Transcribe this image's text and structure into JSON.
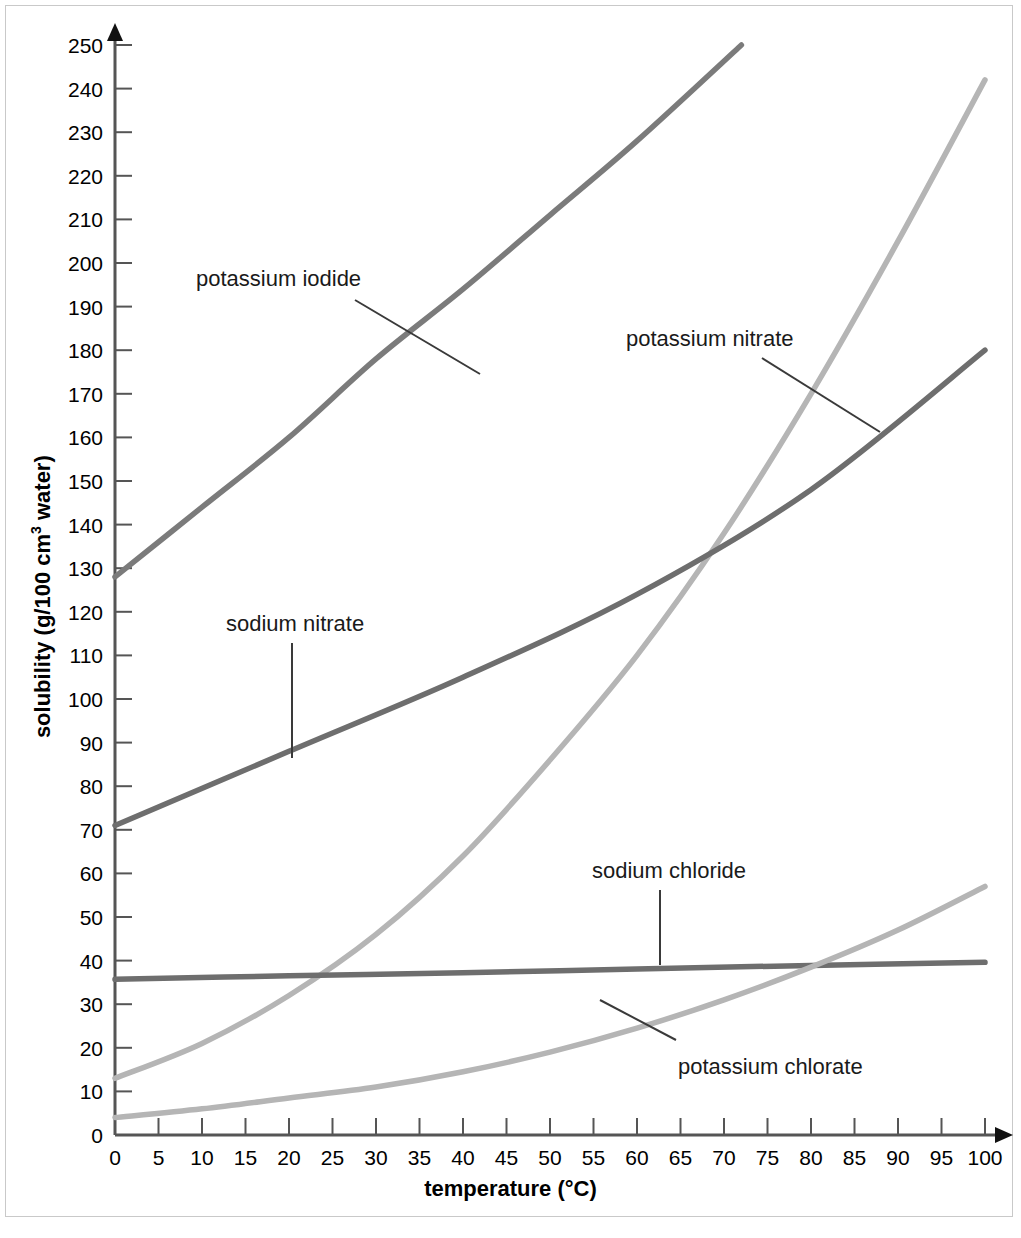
{
  "chart_data": {
    "type": "line",
    "title": "",
    "xlabel": "temperature (°C)",
    "ylabel": "solubility (g/100 cm3 water)",
    "ylabel_parts": {
      "before": "solubility (g/100 cm",
      "sup": "3",
      "after": " water)"
    },
    "xlim": [
      0,
      100
    ],
    "ylim": [
      0,
      250
    ],
    "xticks": [
      0,
      5,
      10,
      15,
      20,
      25,
      30,
      35,
      40,
      45,
      50,
      55,
      60,
      65,
      70,
      75,
      80,
      85,
      90,
      95,
      100
    ],
    "yticks": [
      0,
      10,
      20,
      30,
      40,
      50,
      60,
      70,
      80,
      90,
      100,
      110,
      120,
      130,
      140,
      150,
      160,
      170,
      180,
      190,
      200,
      210,
      220,
      230,
      240,
      250
    ],
    "grid": false,
    "legend": "inline-labels",
    "axis_color": "#555555",
    "series": [
      {
        "name": "potassium iodide",
        "color": "#7b7b7b",
        "label_x": 196,
        "label_y": 268,
        "leader": [
          [
            355,
            300
          ],
          [
            480,
            374
          ]
        ],
        "x": [
          0,
          10,
          20,
          30,
          40,
          50,
          60,
          72
        ],
        "values": [
          128,
          144,
          160,
          178,
          194,
          211,
          228,
          250
        ]
      },
      {
        "name": "potassium nitrate",
        "color": "#b5b5b5",
        "label_x": 626,
        "label_y": 328,
        "leader": [
          [
            762,
            358
          ],
          [
            880,
            432
          ]
        ],
        "x": [
          0,
          10,
          20,
          30,
          40,
          50,
          60,
          70,
          80,
          90,
          100
        ],
        "values": [
          13,
          21,
          32,
          46,
          64,
          86,
          110,
          138,
          170,
          205,
          242
        ]
      },
      {
        "name": "sodium nitrate",
        "color": "#6e6e6e",
        "label_x": 226,
        "label_y": 613,
        "leader": [
          [
            292,
            643
          ],
          [
            292,
            758
          ]
        ],
        "x": [
          0,
          20,
          40,
          60,
          80,
          100
        ],
        "values": [
          71,
          88,
          105,
          124,
          148,
          180
        ]
      },
      {
        "name": "sodium chloride",
        "color": "#6e6e6e",
        "label_x": 592,
        "label_y": 860,
        "leader": [
          [
            660,
            890
          ],
          [
            660,
            965
          ]
        ],
        "x": [
          0,
          20,
          40,
          60,
          80,
          100
        ],
        "values": [
          35.7,
          36.5,
          37.2,
          38.1,
          38.9,
          39.6
        ]
      },
      {
        "name": "potassium chlorate",
        "color": "#b5b5b5",
        "label_x": 678,
        "label_y": 1056,
        "leader": [
          [
            676,
            1040
          ],
          [
            600,
            1000
          ]
        ],
        "x": [
          0,
          10,
          20,
          30,
          40,
          50,
          60,
          70,
          80,
          90,
          100
        ],
        "values": [
          4,
          6,
          8.5,
          11,
          14.5,
          19,
          24.5,
          31,
          38.5,
          47,
          57
        ]
      }
    ]
  }
}
